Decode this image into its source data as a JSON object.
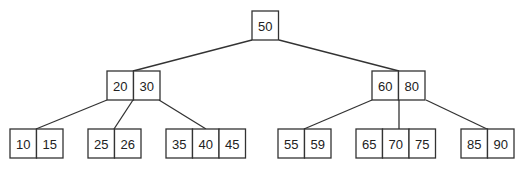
{
  "diagram": {
    "type": "b-tree",
    "colors": {
      "stroke": "#333333",
      "text": "#222222",
      "background": "#ffffff"
    },
    "cell": {
      "width": 26.5,
      "height": 29
    },
    "nodes": [
      {
        "id": "root",
        "level": 0,
        "x": 252,
        "y": 11,
        "keys": [
          "50"
        ]
      },
      {
        "id": "n20_30",
        "level": 1,
        "x": 107,
        "y": 71,
        "keys": [
          "20",
          "30"
        ]
      },
      {
        "id": "n60_80",
        "level": 1,
        "x": 372,
        "y": 71,
        "keys": [
          "60",
          "80"
        ]
      },
      {
        "id": "l10_15",
        "level": 2,
        "x": 10,
        "y": 129,
        "keys": [
          "10",
          "15"
        ]
      },
      {
        "id": "l25_26",
        "level": 2,
        "x": 88,
        "y": 129,
        "keys": [
          "25",
          "26"
        ]
      },
      {
        "id": "l35_45",
        "level": 2,
        "x": 166,
        "y": 129,
        "keys": [
          "35",
          "40",
          "45"
        ]
      },
      {
        "id": "l55_59",
        "level": 2,
        "x": 278,
        "y": 129,
        "keys": [
          "55",
          "59"
        ]
      },
      {
        "id": "l65_75",
        "level": 2,
        "x": 356,
        "y": 129,
        "keys": [
          "65",
          "70",
          "75"
        ]
      },
      {
        "id": "l85_90",
        "level": 2,
        "x": 461,
        "y": 129,
        "keys": [
          "85",
          "90"
        ]
      }
    ],
    "edges": [
      {
        "from": "root",
        "to": "n20_30",
        "x1": 252,
        "y1": 40,
        "x2": 133,
        "y2": 71
      },
      {
        "from": "root",
        "to": "n60_80",
        "x1": 279,
        "y1": 40,
        "x2": 399,
        "y2": 71
      },
      {
        "from": "n20_30",
        "to": "l10_15",
        "x1": 107,
        "y1": 100,
        "x2": 36,
        "y2": 129
      },
      {
        "from": "n20_30",
        "to": "l25_26",
        "x1": 133,
        "y1": 100,
        "x2": 114,
        "y2": 129
      },
      {
        "from": "n20_30",
        "to": "l35_45",
        "x1": 159,
        "y1": 100,
        "x2": 206,
        "y2": 129
      },
      {
        "from": "n60_80",
        "to": "l55_59",
        "x1": 372,
        "y1": 100,
        "x2": 304,
        "y2": 129
      },
      {
        "from": "n60_80",
        "to": "l65_75",
        "x1": 399,
        "y1": 100,
        "x2": 399,
        "y2": 129
      },
      {
        "from": "n60_80",
        "to": "l85_90",
        "x1": 426,
        "y1": 100,
        "x2": 487,
        "y2": 129
      }
    ]
  }
}
